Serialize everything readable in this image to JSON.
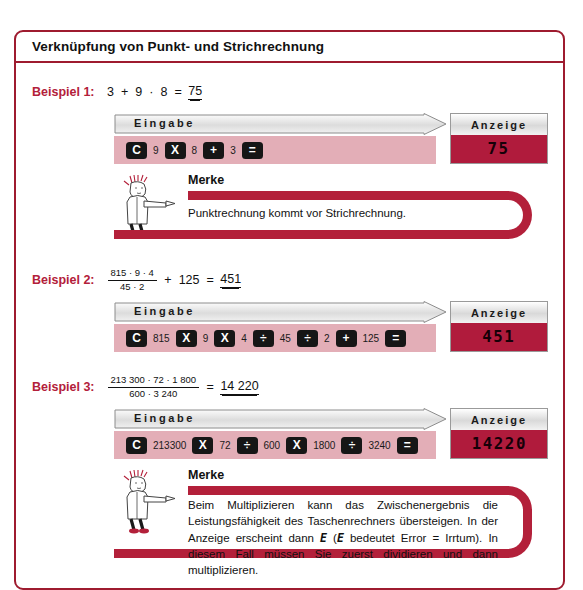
{
  "page": {
    "title": "Verknüpfung von Punkt- und Strichrechnung"
  },
  "labels": {
    "eingabe": "Eingabe",
    "anzeige": "Anzeige",
    "merke": "Merke"
  },
  "examples": [
    {
      "label": "Beispiel 1:",
      "expression_tokens": [
        "3",
        "+",
        "9",
        "·",
        "8",
        "="
      ],
      "result": "75",
      "keys": [
        {
          "type": "key",
          "text": "C"
        },
        {
          "type": "num",
          "text": "9"
        },
        {
          "type": "key",
          "text": "X"
        },
        {
          "type": "num",
          "text": "8"
        },
        {
          "type": "key",
          "text": "+"
        },
        {
          "type": "num",
          "text": "3"
        },
        {
          "type": "key",
          "text": "="
        }
      ],
      "display": "75"
    },
    {
      "label": "Beispiel 2:",
      "fraction": {
        "numerator": "815 · 9 · 4",
        "denominator": "45 · 2"
      },
      "expression_tail": [
        "+",
        "125",
        "="
      ],
      "result": "451",
      "keys": [
        {
          "type": "key",
          "text": "C"
        },
        {
          "type": "num",
          "text": "815"
        },
        {
          "type": "key",
          "text": "X"
        },
        {
          "type": "num",
          "text": "9"
        },
        {
          "type": "key",
          "text": "X"
        },
        {
          "type": "num",
          "text": "4"
        },
        {
          "type": "key",
          "text": "÷"
        },
        {
          "type": "num",
          "text": "45"
        },
        {
          "type": "key",
          "text": "÷"
        },
        {
          "type": "num",
          "text": "2"
        },
        {
          "type": "key",
          "text": "+"
        },
        {
          "type": "num",
          "text": "125"
        },
        {
          "type": "key",
          "text": "="
        }
      ],
      "display": "451"
    },
    {
      "label": "Beispiel 3:",
      "fraction": {
        "numerator": "213 300 · 72 · 1 800",
        "denominator": "600 · 3 240"
      },
      "expression_tail": [
        "="
      ],
      "result": "14 220",
      "keys": [
        {
          "type": "key",
          "text": "C"
        },
        {
          "type": "num",
          "text": "213300"
        },
        {
          "type": "key",
          "text": "X"
        },
        {
          "type": "num",
          "text": "72"
        },
        {
          "type": "key",
          "text": "÷"
        },
        {
          "type": "num",
          "text": "600"
        },
        {
          "type": "key",
          "text": "X"
        },
        {
          "type": "num",
          "text": "1800"
        },
        {
          "type": "key",
          "text": "÷"
        },
        {
          "type": "num",
          "text": "3240"
        },
        {
          "type": "key",
          "text": "="
        }
      ],
      "display": "14220"
    }
  ],
  "merke_notes": [
    {
      "title": "Merke",
      "text": "Punktrechnung kommt vor Strichrechnung."
    },
    {
      "title": "Merke",
      "text_part1": "Beim Multiplizieren kann das Zwischenergebnis die Leistungsfähigkeit des Taschenrechners übersteigen. In der Anzeige erscheint dann ",
      "error_symbol_1": "E",
      "text_part2": " (",
      "error_symbol_2": "E",
      "text_part3": " bedeutet Error = Irrtum). In diesem Fall müssen Sie zuerst dividieren und dann multiplizieren."
    }
  ],
  "colors": {
    "frame": "#9e1b2f",
    "accent_red": "#b3203a",
    "display_red": "#b01b3c",
    "key_band_pink": "#e3aeb7",
    "key_black": "#161616"
  }
}
